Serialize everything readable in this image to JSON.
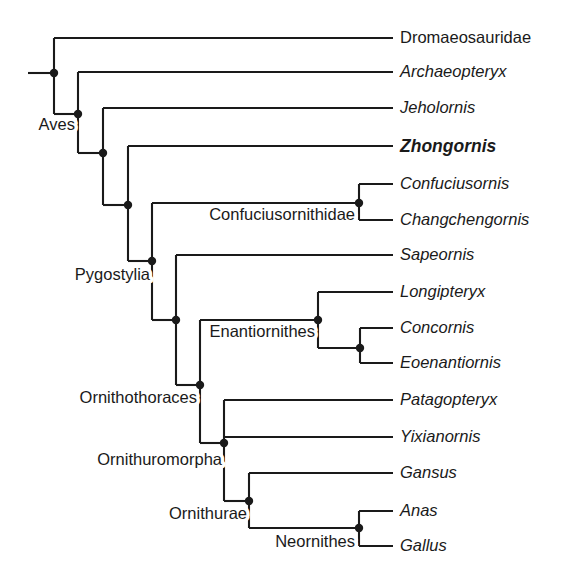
{
  "figure": {
    "type": "cladogram",
    "title": "",
    "background_color": "#ffffff",
    "line_color": "#1a1a1a",
    "focus_taxon": "Zhongornis"
  },
  "taxa": [
    {
      "name": "Dromaeosauridae",
      "style": "roman",
      "tip_y": 38,
      "branch_x": 54
    },
    {
      "name": "Archaeopteryx",
      "style": "italic",
      "tip_y": 72,
      "branch_x": 78
    },
    {
      "name": "Jeholornis",
      "style": "italic",
      "tip_y": 108,
      "branch_x": 103
    },
    {
      "name": "Zhongornis",
      "style": "bolditalic",
      "tip_y": 146,
      "branch_x": 128
    },
    {
      "name": "Confuciusornis",
      "style": "italic",
      "tip_y": 184,
      "branch_x": 359
    },
    {
      "name": "Changchengornis",
      "style": "italic",
      "tip_y": 220,
      "branch_x": 359
    },
    {
      "name": "Sapeornis",
      "style": "italic",
      "tip_y": 255,
      "branch_x": 176
    },
    {
      "name": "Longipteryx",
      "style": "italic",
      "tip_y": 292,
      "branch_x": 318
    },
    {
      "name": "Concornis",
      "style": "italic",
      "tip_y": 328,
      "branch_x": 360
    },
    {
      "name": "Eoenantiornis",
      "style": "italic",
      "tip_y": 363,
      "branch_x": 360
    },
    {
      "name": "Patagopteryx",
      "style": "italic",
      "tip_y": 400,
      "branch_x": 224
    },
    {
      "name": "Yixianornis",
      "style": "italic",
      "tip_y": 437,
      "branch_x": 224
    },
    {
      "name": "Gansus",
      "style": "italic",
      "tip_y": 473,
      "branch_x": 249
    },
    {
      "name": "Anas",
      "style": "italic",
      "tip_y": 511,
      "branch_x": 359
    },
    {
      "name": "Gallus",
      "style": "italic",
      "tip_y": 546,
      "branch_x": 359
    }
  ],
  "clade_labels": [
    {
      "name": "Aves",
      "x": 75,
      "y": 126,
      "anchor": "end"
    },
    {
      "name": "Pygostylia",
      "x": 150,
      "y": 276,
      "anchor": "end"
    },
    {
      "name": "Ornithothoraces",
      "x": 197,
      "y": 399,
      "anchor": "end"
    },
    {
      "name": "Ornithuromorpha",
      "x": 222,
      "y": 461,
      "anchor": "end"
    },
    {
      "name": "Ornithurae",
      "x": 247,
      "y": 515,
      "anchor": "end"
    },
    {
      "name": "Confuciusornithidae",
      "x": 355,
      "y": 216,
      "anchor": "end"
    },
    {
      "name": "Enantiornithes",
      "x": 315,
      "y": 333,
      "anchor": "end"
    },
    {
      "name": "Neornithes",
      "x": 355,
      "y": 543,
      "anchor": "end"
    }
  ],
  "nodes": [
    {
      "id": "root",
      "x": 54,
      "y": 73,
      "span_top": 38,
      "span_bottom": 114,
      "dot": true
    },
    {
      "id": "aves",
      "x": 78,
      "y": 114,
      "span_top": 72,
      "span_bottom": 153,
      "dot": true
    },
    {
      "id": "node-jeholornis",
      "x": 103,
      "y": 153,
      "span_top": 108,
      "span_bottom": 205,
      "dot": true
    },
    {
      "id": "node-zhongornis",
      "x": 128,
      "y": 205,
      "span_top": 146,
      "span_bottom": 261,
      "dot": true
    },
    {
      "id": "pygostylia",
      "x": 152,
      "y": 261,
      "span_top": 203,
      "span_bottom": 320,
      "dot": true
    },
    {
      "id": "node-sapeornis",
      "x": 176,
      "y": 320,
      "span_top": 255,
      "span_bottom": 385,
      "dot": true
    },
    {
      "id": "ornithothoraces",
      "x": 200,
      "y": 385,
      "span_top": 320,
      "span_bottom": 443,
      "dot": true
    },
    {
      "id": "ornithuromorpha",
      "x": 224,
      "y": 443,
      "span_top": 400,
      "span_bottom": 501,
      "dot": true
    },
    {
      "id": "ornithurae",
      "x": 249,
      "y": 501,
      "span_top": 473,
      "span_bottom": 528,
      "dot": true
    },
    {
      "id": "confuciusornithidae",
      "x": 359,
      "y": 203,
      "span_top": 184,
      "span_bottom": 220,
      "dot": true
    },
    {
      "id": "enantiornithes",
      "x": 318,
      "y": 320,
      "span_top": 292,
      "span_bottom": 348,
      "dot": true
    },
    {
      "id": "node-concornis",
      "x": 360,
      "y": 348,
      "span_top": 328,
      "span_bottom": 363,
      "dot": true
    },
    {
      "id": "neornithes",
      "x": 359,
      "y": 528,
      "span_top": 511,
      "span_bottom": 546,
      "dot": true
    }
  ],
  "connectors": [
    {
      "from_x": 28,
      "to_x": 54,
      "y": 73,
      "label": "root-stub"
    },
    {
      "from_x": 54,
      "to_x": 78,
      "y": 114,
      "label": "root-to-aves"
    },
    {
      "from_x": 78,
      "to_x": 103,
      "y": 153,
      "label": "aves-to-jeholornis-node"
    },
    {
      "from_x": 103,
      "to_x": 128,
      "y": 205,
      "label": "jeholornis-node-to-zhongornis-node"
    },
    {
      "from_x": 128,
      "to_x": 152,
      "y": 261,
      "label": "zhongornis-node-to-pygostylia"
    },
    {
      "from_x": 152,
      "to_x": 176,
      "y": 320,
      "label": "pygostylia-to-sapeornis-node"
    },
    {
      "from_x": 176,
      "to_x": 200,
      "y": 385,
      "label": "sapeornis-node-to-ornithothoraces"
    },
    {
      "from_x": 200,
      "to_x": 224,
      "y": 443,
      "label": "ornithothoraces-to-ornithuromorpha"
    },
    {
      "from_x": 224,
      "to_x": 249,
      "y": 501,
      "label": "ornithuromorpha-to-ornithurae"
    },
    {
      "from_x": 249,
      "to_x": 359,
      "y": 528,
      "label": "ornithurae-to-neornithes"
    },
    {
      "from_x": 152,
      "to_x": 359,
      "y": 203,
      "label": "pygostylia-to-confuciusornithidae"
    },
    {
      "from_x": 200,
      "to_x": 318,
      "y": 320,
      "label": "ornithothoraces-to-enantiornithes"
    },
    {
      "from_x": 318,
      "to_x": 360,
      "y": 348,
      "label": "enantiornithes-to-concornis-node"
    }
  ],
  "tip_line_end_x": 393,
  "label_x": 400
}
